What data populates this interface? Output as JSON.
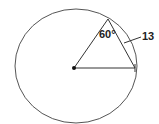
{
  "diagram": {
    "type": "circle-geometry",
    "labels": {
      "angle": "60°",
      "chord_length": "13"
    },
    "colors": {
      "stroke": "#333333",
      "background": "#ffffff"
    }
  }
}
